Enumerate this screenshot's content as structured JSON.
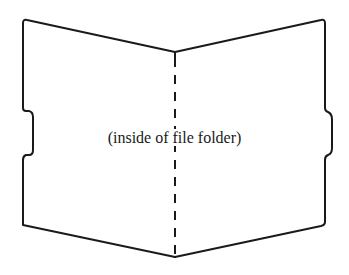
{
  "diagram": {
    "label": "(inside of file folder)",
    "stroke_color": "#1a1a1a",
    "background_color": "#ffffff",
    "parts": [
      {
        "name": "left-panel",
        "description": "left inner panel of folder with recessed tab notch on left edge"
      },
      {
        "name": "right-panel",
        "description": "right inner panel of folder with protruding tab on right edge"
      },
      {
        "name": "center-fold",
        "description": "dashed vertical fold line"
      }
    ]
  }
}
